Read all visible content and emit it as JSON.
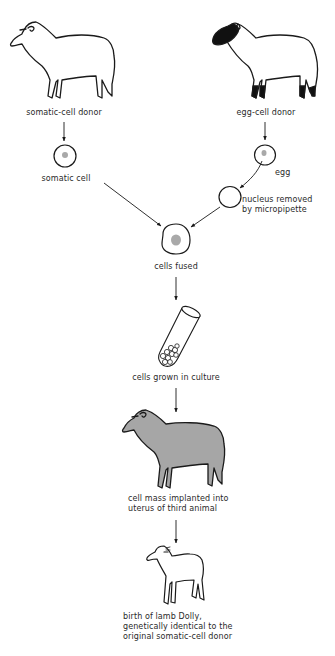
{
  "diagram": {
    "colors": {
      "line": "#1a1a1a",
      "cell_nucleus": "#a9a9a9",
      "implant_sheep_fill": "#a6a6a6",
      "egg_donor_face": "#111111",
      "background": "#ffffff"
    },
    "nodes": {
      "somatic_donor": {
        "label": "somatic-cell donor",
        "icon": "white-sheep-icon"
      },
      "egg_donor": {
        "label": "egg-cell donor",
        "icon": "black-faced-sheep-icon"
      },
      "somatic_cell": {
        "label": "somatic cell",
        "icon": "cell-with-nucleus-icon"
      },
      "egg": {
        "label": "egg",
        "icon": "egg-cell-icon"
      },
      "enucleated": {
        "lines": [
          "nucleus removed",
          "by micropipette"
        ],
        "icon": "empty-cell-icon"
      },
      "fused": {
        "label": "cells fused",
        "icon": "fused-cell-icon"
      },
      "culture": {
        "label": "cells grown in culture",
        "icon": "test-tube-icon"
      },
      "implant": {
        "lines": [
          "cell mass implanted into",
          "uterus of third animal"
        ],
        "icon": "gray-sheep-icon"
      },
      "dolly": {
        "lines": [
          "birth of lamb Dolly,",
          "genetically identical to the",
          "original somatic-cell donor"
        ],
        "icon": "lamb-icon"
      }
    },
    "edges": [
      {
        "from": "somatic_donor",
        "to": "somatic_cell"
      },
      {
        "from": "egg_donor",
        "to": "egg"
      },
      {
        "from": "egg",
        "to": "enucleated"
      },
      {
        "from": "somatic_cell",
        "to": "fused"
      },
      {
        "from": "enucleated",
        "to": "fused"
      },
      {
        "from": "fused",
        "to": "culture"
      },
      {
        "from": "culture",
        "to": "implant"
      },
      {
        "from": "implant",
        "to": "dolly"
      }
    ]
  }
}
